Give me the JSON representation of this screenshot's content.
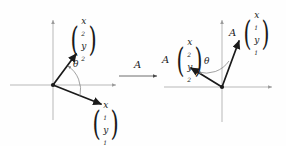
{
  "figure": {
    "background_color": "#fefefe",
    "axis_color": "#9b9b9b",
    "vector_color": "#1a1a1a",
    "arc_color": "#7a7a7a"
  },
  "symbols": {
    "open_paren": "(",
    "close_paren": ")",
    "theta": "θ",
    "matrix_a": "A"
  },
  "left_panel": {
    "name": "original vectors",
    "origin_label": "O",
    "vector_1": {
      "label_x": "x",
      "label_x_sub": "1",
      "label_y": "y",
      "label_y_sub": "1"
    },
    "vector_2": {
      "label_x": "x",
      "label_x_sub": "2",
      "label_y": "y",
      "label_y_sub": "2"
    },
    "angle_label": "θ"
  },
  "transform_arrow": {
    "label": "A",
    "direction": "right"
  },
  "right_panel": {
    "name": "transformed vectors",
    "origin_label": "O",
    "vector_1": {
      "operator": "A",
      "label_x": "x",
      "label_x_sub": "1",
      "label_y": "y",
      "label_y_sub": "1"
    },
    "vector_2": {
      "operator": "A",
      "label_x": "x",
      "label_x_sub": "2",
      "label_y": "y",
      "label_y_sub": "2"
    },
    "angle_label": "θ"
  }
}
